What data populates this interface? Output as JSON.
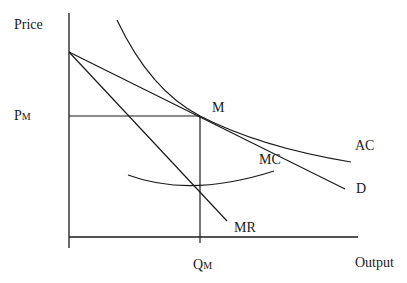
{
  "diagram": {
    "axes": {
      "y_label": "Price",
      "x_label": "Output"
    },
    "points": {
      "equilibrium": "M",
      "price_label": "P",
      "price_sub": "M",
      "quantity_label": "Q",
      "quantity_sub": "M"
    },
    "curves": {
      "ac": "AC",
      "mc": "MC",
      "demand": "D",
      "mr": "MR"
    },
    "colors": {
      "line": "#1a1a1a",
      "background": "#ffffff"
    }
  }
}
